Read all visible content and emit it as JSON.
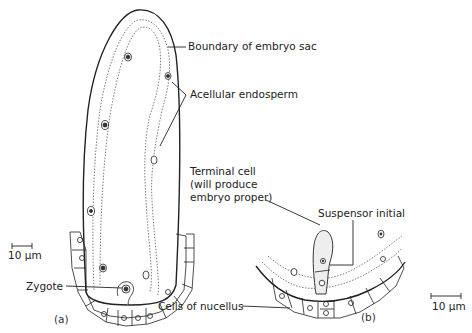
{
  "labels": {
    "boundary": "Boundary of embryo sac",
    "endosperm": "Acellular endosperm",
    "terminal_1": "Terminal cell",
    "terminal_2": "(will produce",
    "terminal_3": "embryo proper)",
    "suspensor": "Suspensor initial",
    "zygote": "Zygote",
    "nucellus": "Cells of nucellus"
  },
  "scale_bars": {
    "a": "10 μm",
    "b": "10 μm"
  },
  "panels": {
    "a": "(a)",
    "b": "(b)"
  }
}
